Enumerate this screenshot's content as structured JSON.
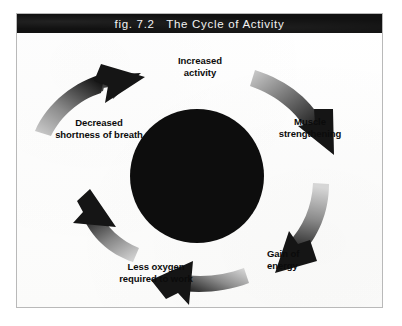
{
  "figure": {
    "title_prefix": "fig. 7.2",
    "title_text": "The Cycle of Activity",
    "title_full": "fig. 7.2   The Cycle of Activity",
    "frame_border_color": "#b9b9b9",
    "title_bar_color": "#111111",
    "title_text_color": "#f2f2f2",
    "background_color": "#fdfdfc"
  },
  "diagram": {
    "type": "cycle",
    "direction": "clockwise",
    "hub": {
      "name": "center-disc",
      "color": "#0d0d0d",
      "cx": 180,
      "cy": 143,
      "r": 67
    },
    "arrow_fill_dark": "#141414",
    "arrow_fill_light": "#c9c9c9",
    "nodes": [
      {
        "id": "increased-activity",
        "label": "Increased\nactivity",
        "line1": "Increased",
        "line2": "activity",
        "position": "top"
      },
      {
        "id": "muscle-strengthening",
        "label": "Muscle\nstrengthening",
        "line1": "Muscle",
        "line2": "strengthening",
        "position": "right"
      },
      {
        "id": "gain-of-energy",
        "label": "Gain of\nenergy",
        "line1": "Gain of",
        "line2": "energy",
        "position": "bottom-right"
      },
      {
        "id": "less-oxygen-required-to-work",
        "label": "Less oxygen\nrequired to work",
        "line1": "Less oxygen",
        "line2": "required to work",
        "position": "bottom-left"
      },
      {
        "id": "decreased-shortness-of-breath",
        "label": "Decreased\nshortness of breath",
        "line1": "Decreased",
        "line2": "shortness of breath",
        "position": "left"
      }
    ],
    "arrows": [
      {
        "id": "arrow-to-increased-activity",
        "from": "decreased-shortness-of-breath",
        "to": "increased-activity"
      },
      {
        "id": "arrow-to-muscle-strengthening",
        "from": "increased-activity",
        "to": "muscle-strengthening"
      },
      {
        "id": "arrow-to-gain-of-energy",
        "from": "muscle-strengthening",
        "to": "gain-of-energy"
      },
      {
        "id": "arrow-to-less-oxygen",
        "from": "gain-of-energy",
        "to": "less-oxygen-required-to-work"
      },
      {
        "id": "arrow-to-decreased-shortness",
        "from": "less-oxygen-required-to-work",
        "to": "decreased-shortness-of-breath"
      }
    ]
  }
}
